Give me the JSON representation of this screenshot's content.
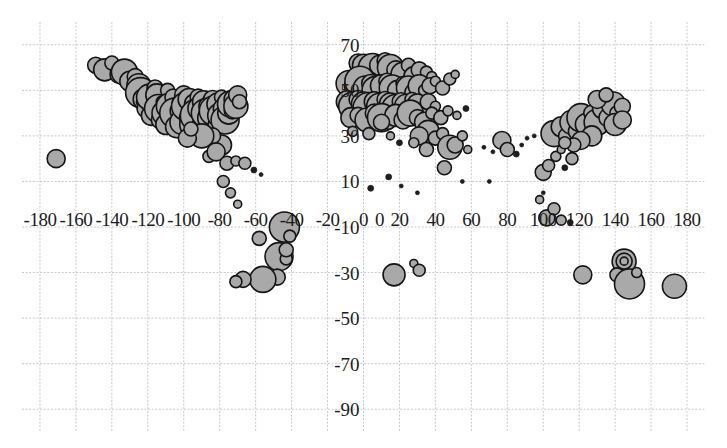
{
  "chart_data": {
    "type": "scatter",
    "title": "",
    "subtitle": "",
    "xlabel": "",
    "ylabel": "",
    "xlim": [
      -190,
      190
    ],
    "ylim": [
      -100,
      80
    ],
    "grid": true,
    "grid_spacing_x": 20,
    "grid_spacing_y": 20,
    "legend": "none",
    "marker": "bubble",
    "marker_fill": "#a9a9a9",
    "marker_stroke": "#141414",
    "xticks": [
      -180,
      -160,
      -140,
      -120,
      -100,
      -80,
      -60,
      -40,
      -20,
      0
    ],
    "xticks_right": [
      0,
      20,
      40,
      60,
      80,
      100,
      120,
      140,
      160,
      180
    ],
    "xtick_labels": [
      "-180",
      "-160",
      "-140",
      "-120",
      "-100",
      "-80",
      "-60",
      "-40",
      "-20",
      "0",
      "0",
      "20",
      "40",
      "60",
      "80",
      "100",
      "120",
      "140",
      "160",
      "180"
    ],
    "yticks": [
      70,
      50,
      30,
      10,
      -10,
      -30,
      -50,
      -70,
      -90
    ],
    "ytick_labels": [
      "70",
      "50",
      "30",
      "10",
      "-10",
      "-30",
      "-50",
      "-70",
      "-90"
    ],
    "note_obscured_labels": [
      "50 label partially hidden behind data points, reads as 5",
      "-10 label overlaps -20 and 0 x-axis labels"
    ],
    "points": [
      {
        "x": -171,
        "y": 20,
        "r": 9
      },
      {
        "x": -149,
        "y": 61,
        "r": 8
      },
      {
        "x": -144,
        "y": 59,
        "r": 11
      },
      {
        "x": -140,
        "y": 62,
        "r": 7
      },
      {
        "x": -136,
        "y": 57,
        "r": 9
      },
      {
        "x": -133,
        "y": 58,
        "r": 13
      },
      {
        "x": -130,
        "y": 54,
        "r": 10
      },
      {
        "x": -127,
        "y": 56,
        "r": 8
      },
      {
        "x": -125,
        "y": 52,
        "r": 12
      },
      {
        "x": -124,
        "y": 49,
        "r": 15
      },
      {
        "x": -122,
        "y": 46,
        "r": 11
      },
      {
        "x": -123,
        "y": 45,
        "r": 6
      },
      {
        "x": -121,
        "y": 42,
        "r": 9
      },
      {
        "x": -119,
        "y": 47,
        "r": 13
      },
      {
        "x": -118,
        "y": 39,
        "r": 10
      },
      {
        "x": -117,
        "y": 44,
        "r": 7
      },
      {
        "x": -116,
        "y": 51,
        "r": 8
      },
      {
        "x": -115,
        "y": 48,
        "r": 11
      },
      {
        "x": -114,
        "y": 42,
        "r": 14
      },
      {
        "x": -113,
        "y": 37,
        "r": 9
      },
      {
        "x": -112,
        "y": 45,
        "r": 6
      },
      {
        "x": -111,
        "y": 40,
        "r": 12
      },
      {
        "x": -110,
        "y": 35,
        "r": 10
      },
      {
        "x": -109,
        "y": 50,
        "r": 7
      },
      {
        "x": -108,
        "y": 43,
        "r": 13
      },
      {
        "x": -107,
        "y": 38,
        "r": 9
      },
      {
        "x": -106,
        "y": 47,
        "r": 8
      },
      {
        "x": -105,
        "y": 40,
        "r": 15
      },
      {
        "x": -104,
        "y": 34,
        "r": 11
      },
      {
        "x": -103,
        "y": 45,
        "r": 6
      },
      {
        "x": -102,
        "y": 41,
        "r": 10
      },
      {
        "x": -101,
        "y": 36,
        "r": 12
      },
      {
        "x": -100,
        "y": 48,
        "r": 9
      },
      {
        "x": -99,
        "y": 43,
        "r": 14
      },
      {
        "x": -98,
        "y": 38,
        "r": 8
      },
      {
        "x": -97,
        "y": 46,
        "r": 11
      },
      {
        "x": -96,
        "y": 41,
        "r": 7
      },
      {
        "x": -95,
        "y": 35,
        "r": 13
      },
      {
        "x": -94,
        "y": 44,
        "r": 10
      },
      {
        "x": -93,
        "y": 39,
        "r": 16
      },
      {
        "x": -92,
        "y": 47,
        "r": 8
      },
      {
        "x": -91,
        "y": 42,
        "r": 12
      },
      {
        "x": -90,
        "y": 36,
        "r": 9
      },
      {
        "x": -89,
        "y": 45,
        "r": 11
      },
      {
        "x": -88,
        "y": 40,
        "r": 14
      },
      {
        "x": -87,
        "y": 34,
        "r": 7
      },
      {
        "x": -86,
        "y": 43,
        "r": 10
      },
      {
        "x": -85,
        "y": 38,
        "r": 13
      },
      {
        "x": -84,
        "y": 46,
        "r": 9
      },
      {
        "x": -83,
        "y": 41,
        "r": 15
      },
      {
        "x": -82,
        "y": 35,
        "r": 8
      },
      {
        "x": -81,
        "y": 44,
        "r": 11
      },
      {
        "x": -80,
        "y": 39,
        "r": 12
      },
      {
        "x": -79,
        "y": 47,
        "r": 7
      },
      {
        "x": -78,
        "y": 42,
        "r": 10
      },
      {
        "x": -77,
        "y": 37,
        "r": 14
      },
      {
        "x": -76,
        "y": 45,
        "r": 9
      },
      {
        "x": -75,
        "y": 40,
        "r": 11
      },
      {
        "x": -74,
        "y": 44,
        "r": 13
      },
      {
        "x": -73,
        "y": 41,
        "r": 8
      },
      {
        "x": -72,
        "y": 46,
        "r": 10
      },
      {
        "x": -71,
        "y": 43,
        "r": 12
      },
      {
        "x": -70,
        "y": 48,
        "r": 9
      },
      {
        "x": -69,
        "y": 45,
        "r": 7
      },
      {
        "x": -79,
        "y": 26,
        "r": 10
      },
      {
        "x": -84,
        "y": 30,
        "r": 8
      },
      {
        "x": -90,
        "y": 30,
        "r": 12
      },
      {
        "x": -98,
        "y": 29,
        "r": 9
      },
      {
        "x": -96,
        "y": 33,
        "r": 7
      },
      {
        "x": -86,
        "y": 21,
        "r": 6
      },
      {
        "x": -82,
        "y": 23,
        "r": 9
      },
      {
        "x": -76,
        "y": 18,
        "r": 7
      },
      {
        "x": -71,
        "y": 19,
        "r": 5
      },
      {
        "x": -66,
        "y": 18,
        "r": 6
      },
      {
        "x": -61,
        "y": 15,
        "r": 3
      },
      {
        "x": -57,
        "y": 13,
        "r": 2
      },
      {
        "x": -74,
        "y": 5,
        "r": 5
      },
      {
        "x": -78,
        "y": 10,
        "r": 6
      },
      {
        "x": -70,
        "y": 0,
        "r": 4
      },
      {
        "x": -58,
        "y": -15,
        "r": 7
      },
      {
        "x": -47,
        "y": -23,
        "r": 14
      },
      {
        "x": -43,
        "y": -24,
        "r": 6
      },
      {
        "x": -43,
        "y": -20,
        "r": 7
      },
      {
        "x": -48,
        "y": -32,
        "r": 8
      },
      {
        "x": -56,
        "y": -33,
        "r": 13
      },
      {
        "x": -67,
        "y": -33,
        "r": 8
      },
      {
        "x": -71,
        "y": -34,
        "r": 6
      },
      {
        "x": -44,
        "y": -10,
        "r": 15
      },
      {
        "x": -41,
        "y": -14,
        "r": 6
      },
      {
        "x": -3,
        "y": 62,
        "r": 9
      },
      {
        "x": 0,
        "y": 61,
        "r": 11
      },
      {
        "x": 5,
        "y": 60,
        "r": 14
      },
      {
        "x": 9,
        "y": 61,
        "r": 10
      },
      {
        "x": 12,
        "y": 63,
        "r": 8
      },
      {
        "x": 15,
        "y": 60,
        "r": 13
      },
      {
        "x": 18,
        "y": 59,
        "r": 9
      },
      {
        "x": 22,
        "y": 57,
        "r": 12
      },
      {
        "x": 25,
        "y": 61,
        "r": 7
      },
      {
        "x": 28,
        "y": 56,
        "r": 10
      },
      {
        "x": 31,
        "y": 59,
        "r": 8
      },
      {
        "x": 35,
        "y": 58,
        "r": 6
      },
      {
        "x": 38,
        "y": 56,
        "r": 5
      },
      {
        "x": -8,
        "y": 53,
        "r": 13
      },
      {
        "x": -5,
        "y": 52,
        "r": 10
      },
      {
        "x": -2,
        "y": 54,
        "r": 15
      },
      {
        "x": 1,
        "y": 51,
        "r": 12
      },
      {
        "x": 4,
        "y": 53,
        "r": 9
      },
      {
        "x": 7,
        "y": 50,
        "r": 14
      },
      {
        "x": 10,
        "y": 52,
        "r": 11
      },
      {
        "x": 13,
        "y": 54,
        "r": 8
      },
      {
        "x": 16,
        "y": 51,
        "r": 13
      },
      {
        "x": 19,
        "y": 50,
        "r": 10
      },
      {
        "x": 22,
        "y": 53,
        "r": 7
      },
      {
        "x": 25,
        "y": 51,
        "r": 12
      },
      {
        "x": 28,
        "y": 49,
        "r": 9
      },
      {
        "x": 31,
        "y": 52,
        "r": 11
      },
      {
        "x": 34,
        "y": 50,
        "r": 6
      },
      {
        "x": 37,
        "y": 52,
        "r": 8
      },
      {
        "x": 40,
        "y": 54,
        "r": 5
      },
      {
        "x": 44,
        "y": 51,
        "r": 7
      },
      {
        "x": 48,
        "y": 55,
        "r": 6
      },
      {
        "x": 51,
        "y": 57,
        "r": 4
      },
      {
        "x": -9,
        "y": 45,
        "r": 11
      },
      {
        "x": -6,
        "y": 43,
        "r": 14
      },
      {
        "x": -3,
        "y": 46,
        "r": 9
      },
      {
        "x": 0,
        "y": 44,
        "r": 12
      },
      {
        "x": 3,
        "y": 42,
        "r": 16
      },
      {
        "x": 6,
        "y": 45,
        "r": 10
      },
      {
        "x": 9,
        "y": 43,
        "r": 13
      },
      {
        "x": 12,
        "y": 46,
        "r": 8
      },
      {
        "x": 15,
        "y": 44,
        "r": 11
      },
      {
        "x": 18,
        "y": 42,
        "r": 14
      },
      {
        "x": 21,
        "y": 45,
        "r": 9
      },
      {
        "x": 24,
        "y": 43,
        "r": 12
      },
      {
        "x": 27,
        "y": 46,
        "r": 7
      },
      {
        "x": 30,
        "y": 44,
        "r": 10
      },
      {
        "x": 33,
        "y": 42,
        "r": 6
      },
      {
        "x": 36,
        "y": 45,
        "r": 8
      },
      {
        "x": 40,
        "y": 43,
        "r": 5
      },
      {
        "x": -7,
        "y": 38,
        "r": 10
      },
      {
        "x": -3,
        "y": 39,
        "r": 8
      },
      {
        "x": 2,
        "y": 37,
        "r": 12
      },
      {
        "x": 6,
        "y": 40,
        "r": 9
      },
      {
        "x": 10,
        "y": 38,
        "r": 14
      },
      {
        "x": 14,
        "y": 36,
        "r": 7
      },
      {
        "x": 18,
        "y": 39,
        "r": 11
      },
      {
        "x": 22,
        "y": 37,
        "r": 9
      },
      {
        "x": 26,
        "y": 40,
        "r": 13
      },
      {
        "x": 30,
        "y": 38,
        "r": 8
      },
      {
        "x": 34,
        "y": 36,
        "r": 10
      },
      {
        "x": 38,
        "y": 40,
        "r": 6
      },
      {
        "x": 43,
        "y": 38,
        "r": 7
      },
      {
        "x": 47,
        "y": 41,
        "r": 5
      },
      {
        "x": 52,
        "y": 39,
        "r": 4
      },
      {
        "x": 57,
        "y": 42,
        "r": 3
      },
      {
        "x": 36,
        "y": 32,
        "r": 11
      },
      {
        "x": 40,
        "y": 29,
        "r": 7
      },
      {
        "x": 44,
        "y": 31,
        "r": 6
      },
      {
        "x": 48,
        "y": 25,
        "r": 12
      },
      {
        "x": 51,
        "y": 26,
        "r": 8
      },
      {
        "x": 55,
        "y": 30,
        "r": 5
      },
      {
        "x": 58,
        "y": 24,
        "r": 4
      },
      {
        "x": 31,
        "y": 30,
        "r": 9
      },
      {
        "x": 35,
        "y": 24,
        "r": 7
      },
      {
        "x": 10,
        "y": 36,
        "r": 8
      },
      {
        "x": 3,
        "y": 31,
        "r": 6
      },
      {
        "x": -6,
        "y": 32,
        "r": 5
      },
      {
        "x": 15,
        "y": 30,
        "r": 4
      },
      {
        "x": 20,
        "y": 27,
        "r": 3
      },
      {
        "x": 28,
        "y": 27,
        "r": 5
      },
      {
        "x": 67,
        "y": 25,
        "r": 2
      },
      {
        "x": 72,
        "y": 23,
        "r": 2
      },
      {
        "x": 77,
        "y": 28,
        "r": 9
      },
      {
        "x": 80,
        "y": 24,
        "r": 7
      },
      {
        "x": 85,
        "y": 22,
        "r": 3
      },
      {
        "x": 88,
        "y": 26,
        "r": 2
      },
      {
        "x": 91,
        "y": 29,
        "r": 2
      },
      {
        "x": 95,
        "y": 30,
        "r": 2
      },
      {
        "x": 100,
        "y": 14,
        "r": 8
      },
      {
        "x": 103,
        "y": 17,
        "r": 6
      },
      {
        "x": 107,
        "y": 21,
        "r": 5
      },
      {
        "x": 110,
        "y": 24,
        "r": 4
      },
      {
        "x": 100,
        "y": 5,
        "r": 2
      },
      {
        "x": 112,
        "y": 16,
        "r": 3
      },
      {
        "x": 116,
        "y": 20,
        "r": 6
      },
      {
        "x": 45,
        "y": 16,
        "r": 7
      },
      {
        "x": 55,
        "y": 10,
        "r": 2
      },
      {
        "x": 70,
        "y": 10,
        "r": 2
      },
      {
        "x": 30,
        "y": 5,
        "r": 2
      },
      {
        "x": 21,
        "y": 8,
        "r": 2
      },
      {
        "x": 106,
        "y": 31,
        "r": 13
      },
      {
        "x": 110,
        "y": 34,
        "r": 10
      },
      {
        "x": 113,
        "y": 30,
        "r": 8
      },
      {
        "x": 116,
        "y": 36,
        "r": 12
      },
      {
        "x": 119,
        "y": 32,
        "r": 9
      },
      {
        "x": 121,
        "y": 38,
        "r": 14
      },
      {
        "x": 124,
        "y": 35,
        "r": 11
      },
      {
        "x": 127,
        "y": 40,
        "r": 8
      },
      {
        "x": 130,
        "y": 36,
        "r": 13
      },
      {
        "x": 133,
        "y": 42,
        "r": 10
      },
      {
        "x": 136,
        "y": 38,
        "r": 9
      },
      {
        "x": 139,
        "y": 44,
        "r": 12
      },
      {
        "x": 141,
        "y": 40,
        "r": 7
      },
      {
        "x": 144,
        "y": 43,
        "r": 8
      },
      {
        "x": 127,
        "y": 30,
        "r": 10
      },
      {
        "x": 121,
        "y": 28,
        "r": 9
      },
      {
        "x": 117,
        "y": 26,
        "r": 7
      },
      {
        "x": 112,
        "y": 27,
        "r": 6
      },
      {
        "x": 130,
        "y": 46,
        "r": 9
      },
      {
        "x": 135,
        "y": 48,
        "r": 7
      },
      {
        "x": 140,
        "y": 35,
        "r": 11
      },
      {
        "x": 144,
        "y": 37,
        "r": 9
      },
      {
        "x": 102,
        "y": -6,
        "r": 8
      },
      {
        "x": 106,
        "y": -2,
        "r": 6
      },
      {
        "x": 110,
        "y": -7,
        "r": 5
      },
      {
        "x": 98,
        "y": 2,
        "r": 4
      },
      {
        "x": 115,
        "y": -8,
        "r": 3
      },
      {
        "x": 4,
        "y": 7,
        "r": 3
      },
      {
        "x": 14,
        "y": 12,
        "r": 3
      },
      {
        "x": 17,
        "y": -31,
        "r": 11
      },
      {
        "x": 28,
        "y": -26,
        "r": 4
      },
      {
        "x": 31,
        "y": -29,
        "r": 6
      },
      {
        "x": 122,
        "y": -31,
        "r": 9
      },
      {
        "x": 145,
        "y": -25,
        "r": 12
      },
      {
        "x": 145,
        "y": -25,
        "r": 8
      },
      {
        "x": 145,
        "y": -25,
        "r": 4
      },
      {
        "x": 141,
        "y": -31,
        "r": 7
      },
      {
        "x": 148,
        "y": -35,
        "r": 15
      },
      {
        "x": 152,
        "y": -30,
        "r": 5
      },
      {
        "x": 173,
        "y": -36,
        "r": 12
      }
    ]
  }
}
